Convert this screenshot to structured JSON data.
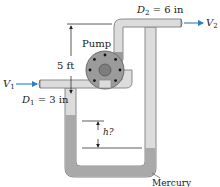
{
  "diagram": {
    "labels": {
      "pump": "Pump",
      "height_dim": "5 ft",
      "outlet_diameter_sym": "D",
      "outlet_diameter_sub": "2",
      "outlet_diameter_val": " = 6 in",
      "inlet_diameter_sym": "D",
      "inlet_diameter_sub": "1",
      "inlet_diameter_val": " = 3 in",
      "inlet_velocity_sym": "V",
      "inlet_velocity_sub": "1",
      "outlet_velocity_sym": "V",
      "outlet_velocity_sub": "2",
      "manometer_height": "h?",
      "fluid": "Mercury"
    },
    "colors": {
      "pipe_fill": "#dcdcdc",
      "pipe_stroke": "#8a8a8a",
      "mercury": "#a9a9a9",
      "pump_body": "#9b9b9b",
      "pump_hub": "#7d7d7d",
      "arrow": "#2d7fc1",
      "line": "#333333"
    }
  }
}
